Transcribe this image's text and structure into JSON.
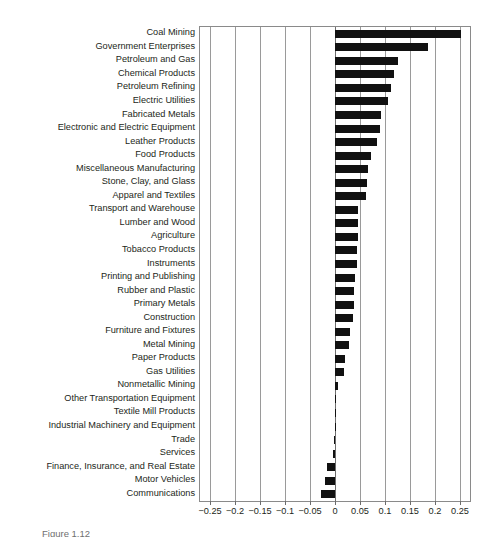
{
  "figure": {
    "caption": "Figure 1.12",
    "axis_color": "#6d6d6d",
    "bar_color": "#111111",
    "grid_color": "#9a9a9a"
  },
  "chart_data": {
    "type": "bar",
    "orientation": "horizontal",
    "title": "",
    "xlabel": "",
    "ylabel": "",
    "xlim": [
      -0.27,
      0.27
    ],
    "grid": true,
    "legend": false,
    "xticks": [
      -0.25,
      -0.2,
      -0.15,
      -0.1,
      -0.05,
      0,
      0.05,
      0.1,
      0.15,
      0.2,
      0.25
    ],
    "xticklabels": [
      "-0.25",
      "-0.2",
      "-0.15",
      "-0.1",
      "-0.05",
      "0",
      "0.05",
      "0.1",
      "0.15",
      "0.2",
      "0.25"
    ],
    "categories": [
      "Coal Mining",
      "Government Enterprises",
      "Petroleum and Gas",
      "Chemical Products",
      "Petroleum Refining",
      "Electric Utilities",
      "Fabricated Metals",
      "Electronic and Electric Equipment",
      "Leather Products",
      "Food Products",
      "Miscellaneous Manufacturing",
      "Stone, Clay, and Glass",
      "Apparel and Textiles",
      "Transport and Warehouse",
      "Lumber and Wood",
      "Agriculture",
      "Tobacco Products",
      "Instruments",
      "Printing and Publishing",
      "Rubber and Plastic",
      "Primary Metals",
      "Construction",
      "Furniture and Fixtures",
      "Metal Mining",
      "Paper Products",
      "Gas Utilities",
      "Nonmetallic Mining",
      "Other Transportation Equipment",
      "Textile Mill Products",
      "Industrial Machinery and Equipment",
      "Trade",
      "Services",
      "Finance, Insurance, and Real Estate",
      "Motor Vehicles",
      "Communications"
    ],
    "values": [
      0.252,
      0.185,
      0.126,
      0.118,
      0.111,
      0.106,
      0.092,
      0.089,
      0.083,
      0.072,
      0.066,
      0.064,
      0.061,
      0.046,
      0.045,
      0.045,
      0.044,
      0.043,
      0.039,
      0.038,
      0.037,
      0.036,
      0.029,
      0.027,
      0.019,
      0.017,
      0.005,
      0.002,
      0.001,
      0.001,
      -0.002,
      -0.004,
      -0.017,
      -0.021,
      -0.029
    ]
  }
}
